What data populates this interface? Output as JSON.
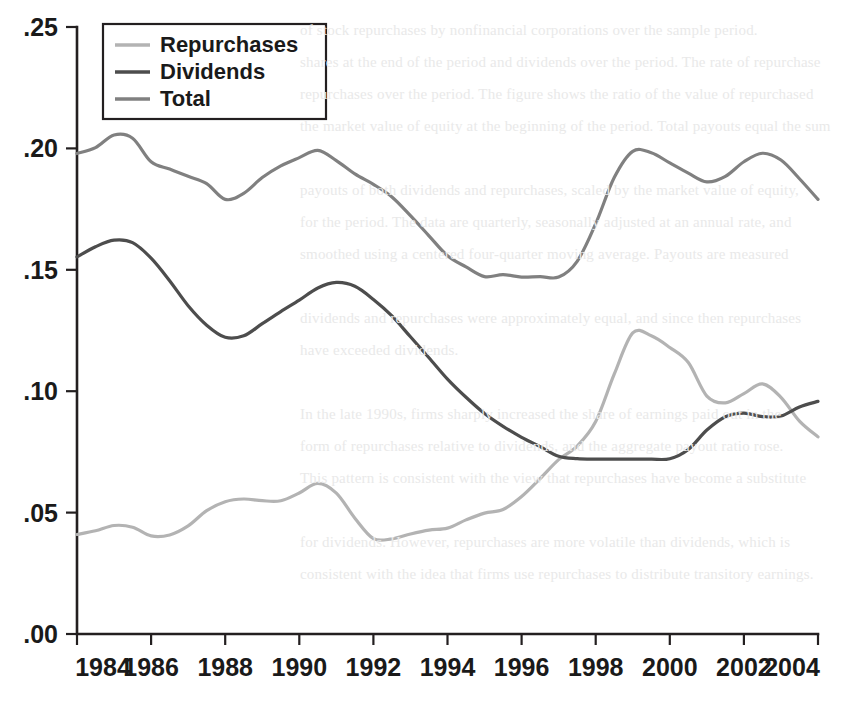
{
  "chart_data": {
    "type": "line",
    "title": "",
    "subtitle": "",
    "xlabel": "",
    "ylabel": "",
    "xlim": [
      1984,
      2004
    ],
    "ylim": [
      0.0,
      0.25
    ],
    "grid": false,
    "legend_position": "top-left",
    "xticks": [
      1984,
      1986,
      1988,
      1990,
      1992,
      1994,
      1996,
      1998,
      2000,
      2002,
      2004
    ],
    "xtick_labels": [
      "1984",
      "1986",
      "1988",
      "1990",
      "1992",
      "1994",
      "1996",
      "1998",
      "2000",
      "2002",
      "2004"
    ],
    "yticks": [
      0.0,
      0.05,
      0.1,
      0.15,
      0.2,
      0.25
    ],
    "ytick_labels": [
      ".00",
      ".05",
      ".10",
      ".15",
      ".20",
      ".25"
    ],
    "x": [
      1984,
      1984.5,
      1985,
      1985.5,
      1986,
      1986.5,
      1987,
      1987.5,
      1988,
      1988.5,
      1989,
      1989.5,
      1990,
      1990.5,
      1991,
      1991.5,
      1992,
      1992.5,
      1993,
      1993.5,
      1994,
      1994.5,
      1995,
      1995.5,
      1996,
      1996.5,
      1997,
      1997.5,
      1998,
      1998.5,
      1999,
      1999.5,
      2000,
      2000.5,
      2001,
      2001.5,
      2002,
      2002.5,
      2003,
      2003.5,
      2004
    ],
    "series": [
      {
        "name": "Repurchases",
        "color": "#b3b3b3",
        "values": [
          0.041,
          0.0425,
          0.0447,
          0.044,
          0.0404,
          0.0408,
          0.0445,
          0.0508,
          0.0545,
          0.0556,
          0.0549,
          0.0549,
          0.0581,
          0.062,
          0.058,
          0.0477,
          0.0393,
          0.0392,
          0.0412,
          0.0428,
          0.0436,
          0.047,
          0.0498,
          0.0513,
          0.0566,
          0.064,
          0.0718,
          0.0774,
          0.0875,
          0.107,
          0.124,
          0.1228,
          0.118,
          0.1118,
          0.098,
          0.0952,
          0.099,
          0.103,
          0.0975,
          0.0877,
          0.0812
        ]
      },
      {
        "name": "Dividends",
        "color": "#4d4d4d",
        "values": [
          0.1553,
          0.1595,
          0.1622,
          0.1612,
          0.1548,
          0.1455,
          0.1352,
          0.1272,
          0.1222,
          0.1228,
          0.1278,
          0.1328,
          0.1375,
          0.1425,
          0.1448,
          0.1432,
          0.1378,
          0.131,
          0.1224,
          0.1138,
          0.105,
          0.0975,
          0.0908,
          0.0855,
          0.081,
          0.0772,
          0.0732,
          0.0722,
          0.072,
          0.072,
          0.072,
          0.072,
          0.0722,
          0.076,
          0.084,
          0.0895,
          0.091,
          0.0895,
          0.0898,
          0.0935,
          0.0958
        ]
      },
      {
        "name": "Total",
        "color": "#808080",
        "values": [
          0.1979,
          0.2003,
          0.2055,
          0.2042,
          0.1945,
          0.1915,
          0.1885,
          0.1855,
          0.179,
          0.1815,
          0.188,
          0.1928,
          0.1962,
          0.1992,
          0.195,
          0.1895,
          0.1852,
          0.18,
          0.1723,
          0.164,
          0.1558,
          0.1512,
          0.1472,
          0.148,
          0.147,
          0.1472,
          0.147,
          0.1535,
          0.169,
          0.188,
          0.1988,
          0.1982,
          0.194,
          0.1898,
          0.1862,
          0.1885,
          0.1945,
          0.198,
          0.1952,
          0.1875,
          0.179
        ]
      }
    ]
  },
  "legend": {
    "items": [
      {
        "label": "Repurchases",
        "color": "#b3b3b3"
      },
      {
        "label": "Dividends",
        "color": "#4d4d4d"
      },
      {
        "label": "Total",
        "color": "#808080"
      }
    ]
  },
  "background_text": {
    "lines": [
      "of stock repurchases by nonfinancial corporations over the sample period.",
      "shares at the end of the period and dividends over the period. The rate of repurchase",
      "repurchases over the period. The figure shows the ratio of the value of repurchased",
      "the market value of equity at the beginning of the period. Total payouts equal the sum",
      "",
      "payouts of both dividends and repurchases, scaled by the market value of equity,",
      "for the period. The data are quarterly, seasonally adjusted at an annual rate, and",
      "smoothed using a centered four-quarter moving average. Payouts are measured",
      "",
      "dividends and repurchases were approximately equal, and since then repurchases",
      "have exceeded dividends.",
      "",
      "In the late 1990s, firms sharply increased the share of earnings paid out in the",
      "form of repurchases relative to dividends, and the aggregate payout ratio rose.",
      "This pattern is consistent with the view that repurchases have become a substitute",
      "",
      "for dividends. However, repurchases are more volatile than dividends, which is",
      "consistent with the idea that firms use repurchases to distribute transitory earnings."
    ]
  }
}
